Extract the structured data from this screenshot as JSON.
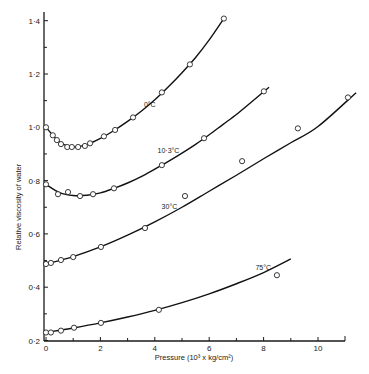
{
  "chart_data": {
    "type": "line",
    "title": "",
    "xlabel": "Pressure (10³ x kg/cm²)",
    "ylabel": "Relative viscosity of water",
    "xlim": [
      0,
      11
    ],
    "ylim": [
      0.2,
      1.43
    ],
    "x_ticks": [
      0,
      2,
      4,
      6,
      8,
      10
    ],
    "x_tick_labels": [
      "0",
      "2",
      "4",
      "6",
      "8",
      "10"
    ],
    "x_minor_ticks": [
      1,
      3,
      5,
      7,
      9
    ],
    "y_ticks": [
      0.2,
      0.4,
      0.6,
      0.8,
      1.0,
      1.2,
      1.4
    ],
    "y_tick_labels": [
      "0·2",
      "0·4",
      "0·6",
      "0·8",
      "1·0",
      "1·2",
      "1·4"
    ],
    "y_minor_ticks": [
      0.3,
      0.5,
      0.7,
      0.9,
      1.1,
      1.3
    ],
    "grid": false,
    "legend": "inline labels on curves",
    "series": [
      {
        "name": "0°C",
        "label_pos": [
          3.6,
          1.075
        ],
        "points": [
          [
            0,
            1.0
          ],
          [
            0.25,
            0.97
          ],
          [
            0.4,
            0.952
          ],
          [
            0.55,
            0.937
          ],
          [
            0.78,
            0.926
          ],
          [
            0.95,
            0.926
          ],
          [
            1.18,
            0.926
          ],
          [
            1.43,
            0.93
          ],
          [
            1.62,
            0.94
          ],
          [
            2.13,
            0.966
          ],
          [
            2.54,
            0.99
          ],
          [
            3.2,
            1.037
          ],
          [
            4.26,
            1.131
          ],
          [
            5.29,
            1.236
          ],
          [
            6.54,
            1.408
          ]
        ],
        "curve": [
          [
            0,
            1.0
          ],
          [
            0.5,
            0.945
          ],
          [
            1.0,
            0.926
          ],
          [
            1.5,
            0.935
          ],
          [
            2.0,
            0.958
          ],
          [
            2.5,
            0.988
          ],
          [
            3.0,
            1.022
          ],
          [
            3.5,
            1.06
          ],
          [
            4.0,
            1.103
          ],
          [
            4.5,
            1.152
          ],
          [
            5.0,
            1.205
          ],
          [
            5.5,
            1.262
          ],
          [
            6.0,
            1.328
          ],
          [
            6.55,
            1.41
          ]
        ]
      },
      {
        "name": "10·3°C",
        "label_pos": [
          4.1,
          0.905
        ],
        "points": [
          [
            0,
            0.786
          ],
          [
            0.44,
            0.749
          ],
          [
            0.81,
            0.757
          ],
          [
            1.25,
            0.742
          ],
          [
            1.73,
            0.749
          ],
          [
            2.5,
            0.771
          ],
          [
            4.26,
            0.858
          ],
          [
            5.81,
            0.959
          ],
          [
            8.01,
            1.135
          ]
        ],
        "curve": [
          [
            0,
            0.786
          ],
          [
            0.5,
            0.755
          ],
          [
            1.0,
            0.744
          ],
          [
            1.5,
            0.745
          ],
          [
            2.0,
            0.754
          ],
          [
            2.5,
            0.771
          ],
          [
            3.0,
            0.791
          ],
          [
            3.5,
            0.815
          ],
          [
            4.0,
            0.843
          ],
          [
            4.5,
            0.872
          ],
          [
            5.0,
            0.903
          ],
          [
            5.5,
            0.936
          ],
          [
            6.0,
            0.972
          ],
          [
            6.5,
            1.01
          ],
          [
            7.0,
            1.048
          ],
          [
            7.5,
            1.09
          ],
          [
            8.2,
            1.15
          ]
        ]
      },
      {
        "name": "30°C",
        "label_pos": [
          4.25,
          0.695
        ],
        "points": [
          [
            0,
            0.487
          ],
          [
            0.18,
            0.491
          ],
          [
            0.55,
            0.502
          ],
          [
            1.0,
            0.513
          ],
          [
            2.02,
            0.551
          ],
          [
            3.64,
            0.622
          ],
          [
            5.11,
            0.742
          ],
          [
            7.21,
            0.873
          ],
          [
            9.26,
            0.996
          ],
          [
            11.1,
            1.112
          ]
        ],
        "curve": [
          [
            0,
            0.487
          ],
          [
            1.0,
            0.515
          ],
          [
            2.0,
            0.551
          ],
          [
            3.0,
            0.595
          ],
          [
            4.0,
            0.645
          ],
          [
            5.0,
            0.7
          ],
          [
            6.0,
            0.76
          ],
          [
            7.0,
            0.82
          ],
          [
            8.0,
            0.882
          ],
          [
            9.0,
            0.942
          ],
          [
            10.0,
            1.003
          ],
          [
            11.4,
            1.13
          ]
        ]
      },
      {
        "name": "75°C",
        "label_pos": [
          7.7,
          0.465
        ],
        "points": [
          [
            0,
            0.23
          ],
          [
            0.18,
            0.23
          ],
          [
            0.55,
            0.237
          ],
          [
            1.03,
            0.248
          ],
          [
            2.02,
            0.266
          ],
          [
            4.15,
            0.315
          ],
          [
            8.49,
            0.445
          ]
        ],
        "curve": [
          [
            0,
            0.23
          ],
          [
            1.0,
            0.247
          ],
          [
            2.0,
            0.266
          ],
          [
            3.0,
            0.288
          ],
          [
            4.0,
            0.313
          ],
          [
            5.0,
            0.342
          ],
          [
            6.0,
            0.375
          ],
          [
            7.0,
            0.413
          ],
          [
            8.0,
            0.455
          ],
          [
            9.0,
            0.506
          ]
        ]
      }
    ]
  }
}
